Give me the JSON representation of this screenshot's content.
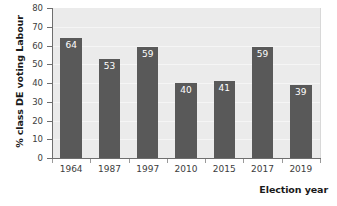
{
  "chart_data": {
    "type": "bar",
    "title": "",
    "subtitle": "",
    "xlabel": "Election year",
    "ylabel": "% class DE voting Labour",
    "categories": [
      "1964",
      "1987",
      "1997",
      "2010",
      "2015",
      "2017",
      "2019"
    ],
    "values": [
      64,
      53,
      59,
      40,
      41,
      59,
      39
    ],
    "data_labels": [
      "64",
      "53",
      "59",
      "40",
      "41",
      "59",
      "39"
    ],
    "ylim": [
      0,
      80
    ],
    "ytick_labels": [
      "0",
      "10",
      "20",
      "30",
      "40",
      "50",
      "60",
      "70",
      "80"
    ],
    "ytick_values": [
      0,
      10,
      20,
      30,
      40,
      50,
      60,
      70,
      80
    ],
    "grid": true,
    "legend": false,
    "legend_position": "none",
    "colors": {
      "bar": "#595959",
      "plot_background": "#ebebeb",
      "figure_background": "#ffffff",
      "axis_line": "#6e6e6e",
      "gridline": "#f5f5f5",
      "data_label_text": "#ffffff",
      "tick_label_text": "#3d3d3d",
      "axis_title_text": "#1a1a1a"
    }
  }
}
